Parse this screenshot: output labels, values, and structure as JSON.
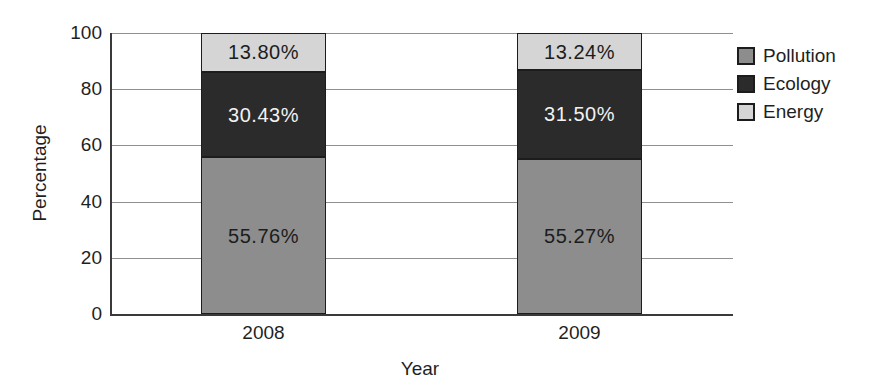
{
  "chart_data": {
    "type": "bar",
    "stacked": true,
    "title": "",
    "xlabel": "Year",
    "ylabel": "Percentage",
    "categories": [
      "2008",
      "2009"
    ],
    "series": [
      {
        "name": "Pollution",
        "values": [
          55.76,
          55.27
        ],
        "labels": [
          "55.76%",
          "55.27%"
        ],
        "color": "#8d8d8d",
        "label_color": "#1c1c1c"
      },
      {
        "name": "Ecology",
        "values": [
          30.43,
          31.5
        ],
        "labels": [
          "30.43%",
          "31.50%"
        ],
        "color": "#2b2b2b",
        "label_color": "#f2f2f2"
      },
      {
        "name": "Energy",
        "values": [
          13.8,
          13.24
        ],
        "labels": [
          "13.80%",
          "13.24%"
        ],
        "color": "#d5d5d5",
        "label_color": "#1c1c1c"
      }
    ],
    "ylim": [
      0,
      100
    ],
    "yticks": [
      "0",
      "20",
      "40",
      "60",
      "80",
      "100"
    ],
    "grid": true,
    "legend": {
      "position": "right",
      "entries": [
        "Pollution",
        "Ecology",
        "Energy"
      ]
    },
    "colors": {
      "axis": "#3a3a3a",
      "gridline": "#8f8f8f",
      "text": "#1f1f1f",
      "segment_border": "#1c1c1c",
      "background": "#ffffff"
    }
  }
}
